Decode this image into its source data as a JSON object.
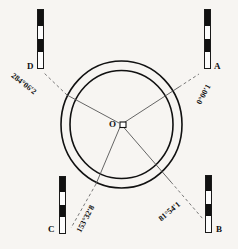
{
  "figure": {
    "background_color": "#f7f5f2",
    "line_color": "#111111",
    "station": {
      "label": "O",
      "marker": "square-station-marker"
    },
    "circles": {
      "outer": {
        "cx": 121.5,
        "cy": 124.5,
        "rx": 60.5,
        "ry": 63.5
      },
      "inner": {
        "cx": 121.5,
        "cy": 124.5,
        "rx": 51.5,
        "ry": 54.0
      }
    },
    "targets": [
      {
        "id": "A",
        "label": "A",
        "angle_text": "0°00′1",
        "angle_rotation": -62,
        "staff_segments": [
          "k",
          "w",
          "k",
          "w"
        ],
        "staff": {
          "left": 204,
          "top": 9,
          "width": 8,
          "height": 60
        },
        "label_pos": {
          "left": 213,
          "top": 63
        },
        "angle_pos": {
          "left": 198,
          "top": 99
        },
        "ray_to": {
          "x": 195,
          "y": 72
        }
      },
      {
        "id": "B",
        "label": "B",
        "angle_text": "81°54′1",
        "angle_rotation": -40,
        "staff_segments": [
          "k",
          "w",
          "k",
          "w"
        ],
        "staff": {
          "left": 205,
          "top": 175,
          "width": 8,
          "height": 58
        },
        "label_pos": {
          "left": 215,
          "top": 226
        },
        "angle_pos": {
          "left": 159,
          "top": 214
        },
        "ray_to": {
          "x": 200,
          "y": 216
        }
      },
      {
        "id": "C",
        "label": "C",
        "angle_text": "153°32′8",
        "angle_rotation": -62,
        "staff_segments": [
          "k",
          "w",
          "k",
          "w"
        ],
        "staff": {
          "left": 59,
          "top": 176,
          "width": 8,
          "height": 58
        },
        "label_pos": {
          "left": 49,
          "top": 226
        },
        "angle_pos": {
          "left": 80,
          "top": 226
        },
        "ray_to": {
          "x": 73,
          "y": 221
        }
      },
      {
        "id": "D",
        "label": "D",
        "angle_text": "284°06′2",
        "angle_rotation": 38,
        "staff_segments": [
          "k",
          "w",
          "k",
          "w"
        ],
        "staff": {
          "left": 37,
          "top": 9,
          "width": 8,
          "height": 60
        },
        "label_pos": {
          "left": 27,
          "top": 63
        },
        "angle_pos": {
          "left": 14,
          "top": 73
        },
        "ray_to": {
          "x": 47,
          "y": 72
        }
      }
    ],
    "center_label_pos": {
      "left": 108,
      "top": 120
    }
  }
}
